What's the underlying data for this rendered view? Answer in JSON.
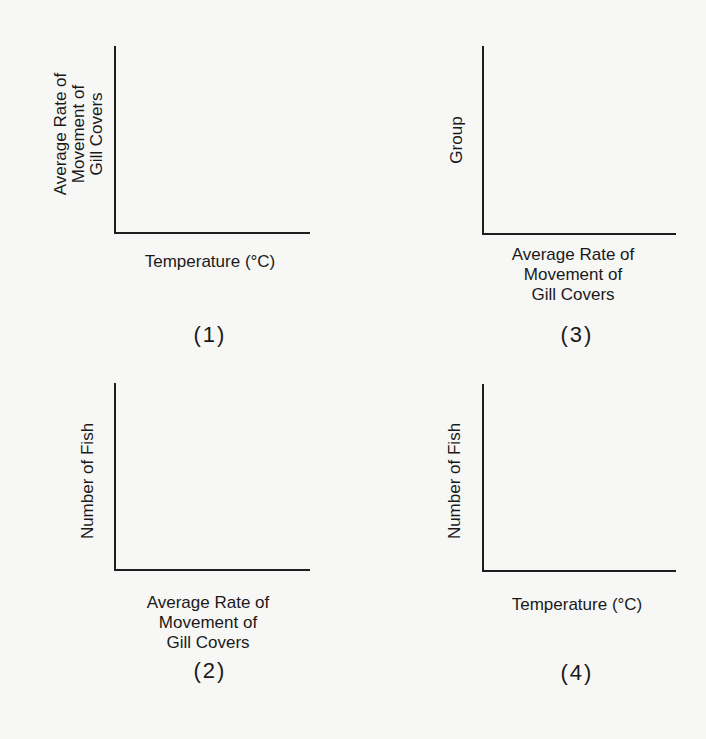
{
  "graphs": [
    {
      "id": "(1)",
      "ylabel_lines": [
        "Average Rate of",
        "Movement of",
        "Gill Covers"
      ],
      "xlabel_lines": [
        "Temperature (°C)"
      ]
    },
    {
      "id": "(2)",
      "ylabel_lines": [
        "Number of Fish"
      ],
      "xlabel_lines": [
        "Average Rate of",
        "Movement of",
        "Gill Covers"
      ]
    },
    {
      "id": "(3)",
      "ylabel_lines": [
        "Group"
      ],
      "xlabel_lines": [
        "Average Rate of",
        "Movement of",
        "Gill Covers"
      ]
    },
    {
      "id": "(4)",
      "ylabel_lines": [
        "Number of Fish"
      ],
      "xlabel_lines": [
        "Temperature (°C)"
      ]
    }
  ],
  "colors": {
    "background": "#f7f7f6",
    "axis": "#1e1e1e",
    "text": "#1a1a1a"
  }
}
